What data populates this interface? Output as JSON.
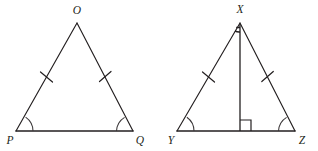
{
  "figure": {
    "background_color": "#ffffff",
    "stroke_color": "#231f20",
    "width": 318,
    "height": 151
  },
  "triangles": [
    {
      "name": "triangle-opq",
      "label": "OPQ",
      "apex_label": "O",
      "left_base_label": "P",
      "right_base_label": "Q",
      "apex": {
        "x": 77,
        "y": 23
      },
      "left_base": {
        "x": 16,
        "y": 131
      },
      "right_base": {
        "x": 133,
        "y": 131
      },
      "leg_tick_count": 1,
      "base_angle_arc_count": 1,
      "has_altitude": false,
      "has_apex_angle_mark": false,
      "has_right_angle_mark": false
    },
    {
      "name": "triangle-xyz",
      "label": "XYZ",
      "apex_label": "X",
      "left_base_label": "Y",
      "right_base_label": "Z",
      "apex": {
        "x": 240,
        "y": 23
      },
      "left_base": {
        "x": 177,
        "y": 131
      },
      "right_base": {
        "x": 295,
        "y": 131
      },
      "altitude_foot": {
        "x": 240,
        "y": 131
      },
      "leg_tick_count": 1,
      "base_angle_arc_count": 1,
      "has_altitude": true,
      "has_apex_angle_mark": true,
      "has_right_angle_mark": true,
      "right_angle_mark_size": 11
    }
  ],
  "labels": {
    "o": "O",
    "p": "P",
    "q": "Q",
    "x": "X",
    "y": "Y",
    "z": "Z"
  }
}
